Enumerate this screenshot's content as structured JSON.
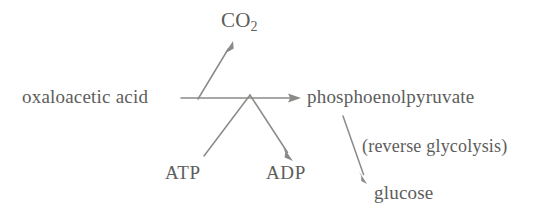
{
  "diagram": {
    "type": "reaction-pathway",
    "background_color": "#ffffff",
    "stroke_color": "#8a8a88",
    "text_color": "#5d5d5b",
    "nodes": [
      {
        "id": "oxaloacetic-acid",
        "label": "oxaloacetic acid",
        "x": 22,
        "y": 87
      },
      {
        "id": "co2",
        "label": "CO",
        "subscript": "2",
        "x": 221,
        "y": 10
      },
      {
        "id": "phosphoenolpyruvate",
        "label": "phosphoenolpyruvate",
        "x": 307,
        "y": 87
      },
      {
        "id": "atp",
        "label": "ATP",
        "x": 165,
        "y": 163
      },
      {
        "id": "adp",
        "label": "ADP",
        "x": 266,
        "y": 163
      },
      {
        "id": "glucose",
        "label": "glucose",
        "x": 374,
        "y": 183
      }
    ],
    "annotations": [
      {
        "id": "reverse-glycolysis",
        "label": "(reverse glycolysis)",
        "x": 362,
        "y": 137
      }
    ],
    "arrows": [
      {
        "id": "oxaloacetic-to-pep",
        "from": "oxaloacetic-acid",
        "to": "phosphoenolpyruvate",
        "kind": "main-horizontal"
      },
      {
        "id": "to-co2",
        "from": "oxaloacetic-to-pep",
        "to": "co2",
        "kind": "branch-up"
      },
      {
        "id": "atp-to-adp",
        "from": "atp",
        "to": "adp",
        "kind": "cofactor-chevron"
      },
      {
        "id": "pep-to-glucose",
        "from": "phosphoenolpyruvate",
        "to": "glucose",
        "kind": "branch-down"
      }
    ]
  }
}
